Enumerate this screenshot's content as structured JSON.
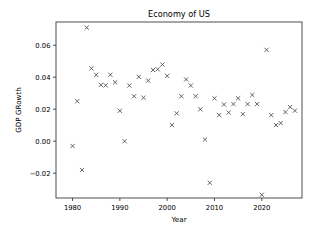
{
  "figure": {
    "background_color": "#ffffff",
    "marker_color": "#4a4a4a",
    "axis_color": "#3a3a3a"
  },
  "chart_data": {
    "type": "scatter",
    "title": "Economy of US",
    "xlabel": "Year",
    "ylabel": "GDP GRowth",
    "marker": "x",
    "grid": false,
    "legend": null,
    "xlim": [
      1976.5,
      2028.5
    ],
    "ylim": [
      -0.0355,
      0.0745
    ],
    "xticks": [
      1980,
      1990,
      2000,
      2010,
      2020
    ],
    "xticklabels": [
      "1980",
      "1990",
      "2000",
      "2010",
      "2020"
    ],
    "yticks": [
      -0.02,
      0.0,
      0.02,
      0.04,
      0.06
    ],
    "yticklabels": [
      "−0.02",
      "0.00",
      "0.02",
      "0.04",
      "0.06"
    ],
    "x": [
      1980,
      1981,
      1982,
      1983,
      1984,
      1985,
      1986,
      1987,
      1988,
      1989,
      1990,
      1991,
      1992,
      1993,
      1994,
      1995,
      1996,
      1997,
      1998,
      1999,
      2000,
      2001,
      2002,
      2003,
      2004,
      2005,
      2006,
      2007,
      2008,
      2009,
      2010,
      2011,
      2012,
      2013,
      2014,
      2015,
      2016,
      2017,
      2018,
      2019,
      2020,
      2021,
      2022,
      2023,
      2024,
      2025,
      2026,
      2027
    ],
    "y": [
      -0.003,
      0.025,
      -0.018,
      0.071,
      0.0455,
      0.0415,
      0.0352,
      0.0349,
      0.0415,
      0.0368,
      0.019,
      0.0,
      0.0348,
      0.0281,
      0.0402,
      0.0272,
      0.0379,
      0.0445,
      0.0449,
      0.0479,
      0.0409,
      0.0101,
      0.0174,
      0.0281,
      0.0386,
      0.0348,
      0.0281,
      0.0199,
      0.001,
      -0.026,
      0.0268,
      0.0163,
      0.0229,
      0.0179,
      0.0232,
      0.0268,
      0.0169,
      0.0232,
      0.0289,
      0.0232,
      -0.0335,
      0.0571,
      0.0163,
      0.0101,
      0.0113,
      0.0182,
      0.0213,
      0.0191
    ]
  }
}
